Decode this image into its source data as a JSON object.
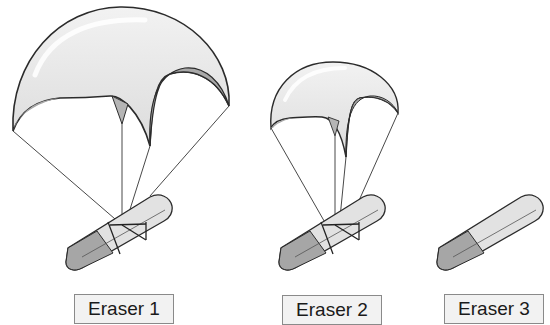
{
  "diagram": {
    "colors": {
      "background": "#ffffff",
      "canopy_light": "#e6e6e6",
      "canopy_shadow": "#a8a8a8",
      "canopy_outline": "#2b2b2b",
      "eraser_light": "#e2e2e2",
      "eraser_dark": "#a6a6a6",
      "string": "#333333",
      "label_bg": "#f2f2f2",
      "label_border": "#8a8a8a"
    },
    "items": [
      {
        "id": "eraser-1",
        "label": "Eraser 1",
        "parachute": "large"
      },
      {
        "id": "eraser-2",
        "label": "Eraser 2",
        "parachute": "small"
      },
      {
        "id": "eraser-3",
        "label": "Eraser 3",
        "parachute": "none"
      }
    ]
  }
}
